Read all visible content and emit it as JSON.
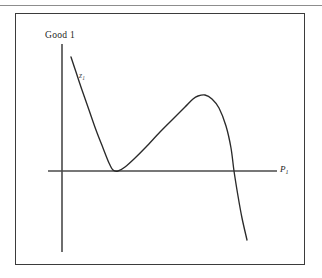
{
  "figure": {
    "background_color": "#ffffff",
    "frame_color": "#3b3b3b",
    "ink_color": "#1d1d1d",
    "top_rule_color": "#8d8d8d"
  },
  "labels": {
    "y_axis": "Good 1",
    "x_axis_base": "P",
    "x_axis_sub": "1",
    "curve_base": "z",
    "curve_sub": "1"
  },
  "chart_data": {
    "type": "line",
    "title": "",
    "xlabel": "P₁",
    "ylabel": "Good 1",
    "grid": false,
    "legend": "none",
    "annotations": [
      {
        "text": "Good 1",
        "position": "top-left, above vertical axis"
      },
      {
        "text": "P₁",
        "position": "right end of horizontal axis"
      },
      {
        "text": "z₁",
        "position": "upper-left, beside descending branch of curve"
      }
    ],
    "axes": {
      "vertical_axis_x_px": 62,
      "vertical_axis_top_px": 44,
      "vertical_axis_bottom_px": 252,
      "horizontal_axis_y_px": 171,
      "horizontal_axis_left_px": 48,
      "horizontal_axis_right_px": 277
    },
    "series": [
      {
        "name": "z₁",
        "description": "Excess demand curve: steep decline from upper left, tangent minimum touching the horizontal axis, rise to a local maximum, then steep fall crossing the axis",
        "points_px": [
          [
            71,
            57
          ],
          [
            76,
            72
          ],
          [
            82,
            90
          ],
          [
            89,
            110
          ],
          [
            96,
            130
          ],
          [
            103,
            148
          ],
          [
            109,
            163
          ],
          [
            113,
            170
          ],
          [
            118,
            171
          ],
          [
            125,
            167
          ],
          [
            134,
            159
          ],
          [
            146,
            147
          ],
          [
            160,
            132
          ],
          [
            174,
            118
          ],
          [
            185,
            107
          ],
          [
            193,
            99
          ],
          [
            198,
            96
          ],
          [
            205,
            95
          ],
          [
            212,
            99
          ],
          [
            219,
            108
          ],
          [
            226,
            126
          ],
          [
            231,
            148
          ],
          [
            234,
            171
          ],
          [
            238,
            196
          ],
          [
            242,
            218
          ],
          [
            247,
            240
          ]
        ],
        "key_features": [
          {
            "label": "tangent minimum on axis",
            "x_px": 114,
            "y_px": 171
          },
          {
            "label": "local maximum",
            "x_px": 200,
            "y_px": 95
          },
          {
            "label": "axis crossing (equilibrium price)",
            "x_px": 234,
            "y_px": 171
          },
          {
            "label": "curve start",
            "x_px": 71,
            "y_px": 57
          },
          {
            "label": "curve end",
            "x_px": 247,
            "y_px": 240
          }
        ]
      }
    ]
  }
}
